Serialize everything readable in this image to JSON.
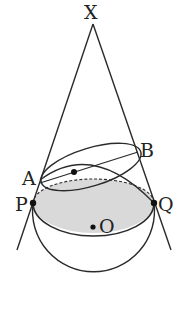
{
  "diagram": {
    "labels": {
      "apex": "X",
      "point_a": "A",
      "point_b": "B",
      "point_p": "P",
      "point_q": "Q",
      "center": "O"
    },
    "colors": {
      "stroke": "#2a2a2a",
      "shaded_region": "#d9d9d9",
      "background": "#ffffff"
    }
  }
}
